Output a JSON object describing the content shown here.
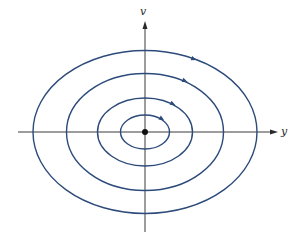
{
  "diagram": {
    "title": "",
    "type": "phase-portrait",
    "axes": {
      "horizontal": {
        "label": "y"
      },
      "vertical": {
        "label": "v"
      }
    },
    "center": {
      "x": 145,
      "y": 132
    },
    "colors": {
      "orbit": "#2c4a7a",
      "axis": "#3a3a3a",
      "background": "#ffffff"
    },
    "orbits": [
      {
        "rx": 24.5,
        "ry": 17,
        "arrow": {
          "x": 162,
          "y": 119
        }
      },
      {
        "rx": 47.5,
        "ry": 34,
        "arrow": {
          "x": 173,
          "y": 104
        }
      },
      {
        "rx": 78.5,
        "ry": 58.5,
        "arrow": {
          "x": 185,
          "y": 81
        }
      },
      {
        "rx": 112,
        "ry": 81.5,
        "arrow": {
          "x": 194,
          "y": 59
        }
      }
    ],
    "equilibrium_point": {
      "x": 145,
      "y": 132
    },
    "orientation": "clockwise"
  }
}
